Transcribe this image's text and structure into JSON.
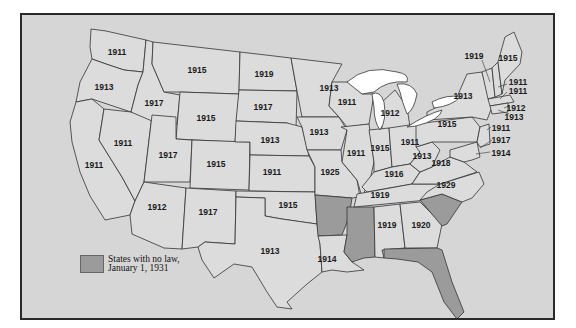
{
  "map": {
    "legend": {
      "line1": "States with no law,",
      "line2": "January 1, 1931",
      "swatch_color": "#9b9b9b"
    },
    "no_law_states": [
      "Arkansas",
      "Mississippi",
      "South Carolina",
      "Florida"
    ],
    "states": {
      "WA": "1911",
      "OR": "1913",
      "ID": "1917",
      "MT": "1915",
      "WY": "1915",
      "NV": "1911",
      "CA": "1911",
      "UT": "1917",
      "CO": "1915",
      "AZ": "1912",
      "NM": "1917",
      "ND": "1919",
      "SD": "1917",
      "NE": "1913",
      "KS": "1911",
      "OK": "1915",
      "TX": "1913",
      "MN": "1913",
      "IA": "1913",
      "MO": "1925",
      "LA": "1914",
      "WI": "1911",
      "IL": "1911",
      "MI": "1912",
      "IN": "1915",
      "OH": "1911",
      "KY": "1916",
      "TN": "1919",
      "AL": "1919",
      "GA": "1920",
      "WV": "1913",
      "VA": "1918",
      "NC": "1929",
      "PA": "1915",
      "NY": "1913",
      "VT": "1919",
      "ME": "1915",
      "NH": "1911",
      "MA": "1911",
      "RI": "1912",
      "CT": "1913",
      "NJ": "1911",
      "DE": "1917",
      "MD": "1914"
    }
  }
}
